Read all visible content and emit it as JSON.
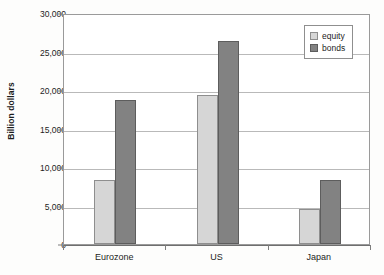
{
  "chart_data": {
    "type": "bar",
    "title": "",
    "xlabel": "",
    "ylabel": "Billion dollars",
    "categories": [
      "Eurozone",
      "US",
      "Japan"
    ],
    "series": [
      {
        "name": "equity",
        "color": "#d6d6d6",
        "values": [
          8300,
          19400,
          4500
        ]
      },
      {
        "name": "bonds",
        "color": "#828282",
        "values": [
          18700,
          26400,
          8300
        ]
      }
    ],
    "ylim": [
      0,
      30000
    ],
    "ytick_values": [
      0,
      5000,
      10000,
      15000,
      20000,
      25000,
      30000
    ],
    "ytick_labels": [
      "0",
      "5,000",
      "10,000",
      "15,000",
      "20,000",
      "25,000",
      "30,000"
    ],
    "grid": true,
    "grid_axis": "y",
    "legend_position": "top-right"
  },
  "legend": {
    "entries": [
      {
        "label": "equity"
      },
      {
        "label": "bonds"
      }
    ]
  }
}
